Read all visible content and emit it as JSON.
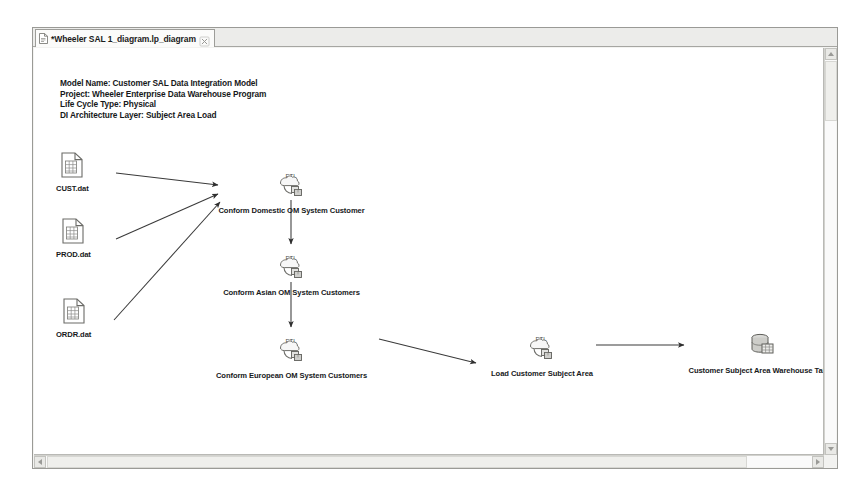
{
  "window": {
    "tab": {
      "label": "*Wheeler SAL 1_diagram.lp_diagram",
      "doc_icon": "document-icon",
      "close_icon": "close-icon"
    }
  },
  "scrollbars": {
    "vertical": {
      "up_icon": "scroll-up-arrow-icon",
      "down_icon": "scroll-down-arrow-icon"
    },
    "horizontal": {
      "left_icon": "scroll-left-arrow-icon",
      "right_icon": "scroll-right-arrow-icon"
    }
  },
  "model_header": {
    "lines": [
      "Model Name: Customer SAL Data Integration Model",
      "Project: Wheeler Enterprise Data Warehouse Program",
      "Life Cycle Type: Physical",
      "DI Architecture Layer: Subject Area Load"
    ]
  },
  "diagram": {
    "nodes": [
      {
        "id": "cust-dat",
        "label": "CUST.dat",
        "icon": "data-file-icon",
        "x": 52,
        "y": 105
      },
      {
        "id": "prod-dat",
        "label": "PROD.dat",
        "icon": "data-file-icon",
        "x": 52,
        "y": 172
      },
      {
        "id": "ordr-dat",
        "label": "ORDR.dat",
        "icon": "data-file-icon",
        "x": 52,
        "y": 252
      },
      {
        "id": "conform-domestic",
        "label": "Conform Domestic OM System Customer",
        "icon": "etl-process-icon",
        "x": 255,
        "y": 120
      },
      {
        "id": "conform-asian",
        "label": "Conform Asian OM System Customers",
        "icon": "etl-process-icon",
        "x": 255,
        "y": 202
      },
      {
        "id": "conform-european",
        "label": "Conform European OM System Customers",
        "icon": "etl-process-icon",
        "x": 255,
        "y": 285
      },
      {
        "id": "load-customer-subject-area",
        "label": "Load Customer Subject Area",
        "icon": "etl-process-icon",
        "x": 500,
        "y": 285
      },
      {
        "id": "customer-warehouse-tables",
        "label": "Customer Subject Area Warehouse Tables",
        "icon": "database-icon",
        "x": 700,
        "y": 282
      }
    ],
    "edges": [
      {
        "from": "cust-dat",
        "to": "conform-domestic"
      },
      {
        "from": "prod-dat",
        "to": "conform-domestic"
      },
      {
        "from": "ordr-dat",
        "to": "conform-domestic"
      },
      {
        "from": "conform-domestic",
        "to": "conform-asian"
      },
      {
        "from": "conform-asian",
        "to": "conform-european"
      },
      {
        "from": "conform-european",
        "to": "load-customer-subject-area"
      },
      {
        "from": "load-customer-subject-area",
        "to": "customer-warehouse-tables"
      }
    ],
    "etl_icon_text": "ETL"
  },
  "colors": {
    "canvas": "#ffffff",
    "connector": "#3a3a3a",
    "text": "#17191b",
    "chrome": "#f3f3f1"
  }
}
